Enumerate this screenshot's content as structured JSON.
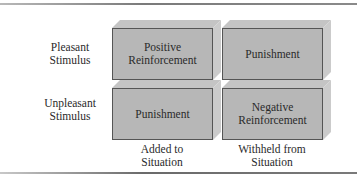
{
  "diagram": {
    "rows": [
      {
        "label_line1": "Pleasant",
        "label_line2": "Stimulus"
      },
      {
        "label_line1": "Unpleasant",
        "label_line2": "Stimulus"
      }
    ],
    "columns": [
      {
        "label_line1": "Added to",
        "label_line2": "Situation"
      },
      {
        "label_line1": "Withheld from",
        "label_line2": "Situation"
      }
    ],
    "cells": [
      {
        "line1": "Positive",
        "line2": "Reinforcement"
      },
      {
        "line1": "Punishment",
        "line2": ""
      },
      {
        "line1": "Punishment",
        "line2": ""
      },
      {
        "line1": "Negative",
        "line2": "Reinforcement"
      }
    ],
    "colors": {
      "box_front": "#b7b7b7",
      "box_top": "#c4c4c4",
      "box_side": "#cbcbcb",
      "box_border": "#555555",
      "text": "#2a2a2a"
    }
  }
}
